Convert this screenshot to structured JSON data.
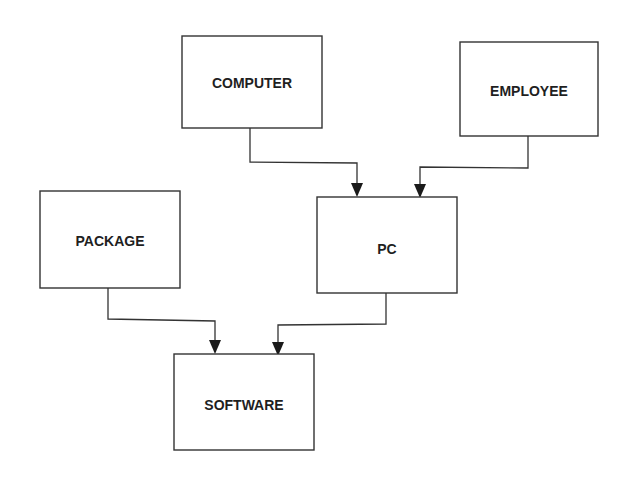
{
  "diagram": {
    "type": "entity-relationship flow",
    "stroke_color": "#333333",
    "background": "#ffffff",
    "nodes": [
      {
        "id": "computer",
        "label": "COMPUTER",
        "x": 182,
        "y": 36,
        "w": 140,
        "h": 92
      },
      {
        "id": "employee",
        "label": "EMPLOYEE",
        "x": 460,
        "y": 42,
        "w": 138,
        "h": 94
      },
      {
        "id": "package",
        "label": "PACKAGE",
        "x": 40,
        "y": 191,
        "w": 140,
        "h": 97
      },
      {
        "id": "pc",
        "label": "PC",
        "x": 317,
        "y": 197,
        "w": 140,
        "h": 96
      },
      {
        "id": "software",
        "label": "SOFTWARE",
        "x": 174,
        "y": 354,
        "w": 140,
        "h": 96
      }
    ],
    "edges": [
      {
        "from": "computer",
        "to": "pc"
      },
      {
        "from": "employee",
        "to": "pc"
      },
      {
        "from": "package",
        "to": "software"
      },
      {
        "from": "pc",
        "to": "software"
      }
    ]
  }
}
